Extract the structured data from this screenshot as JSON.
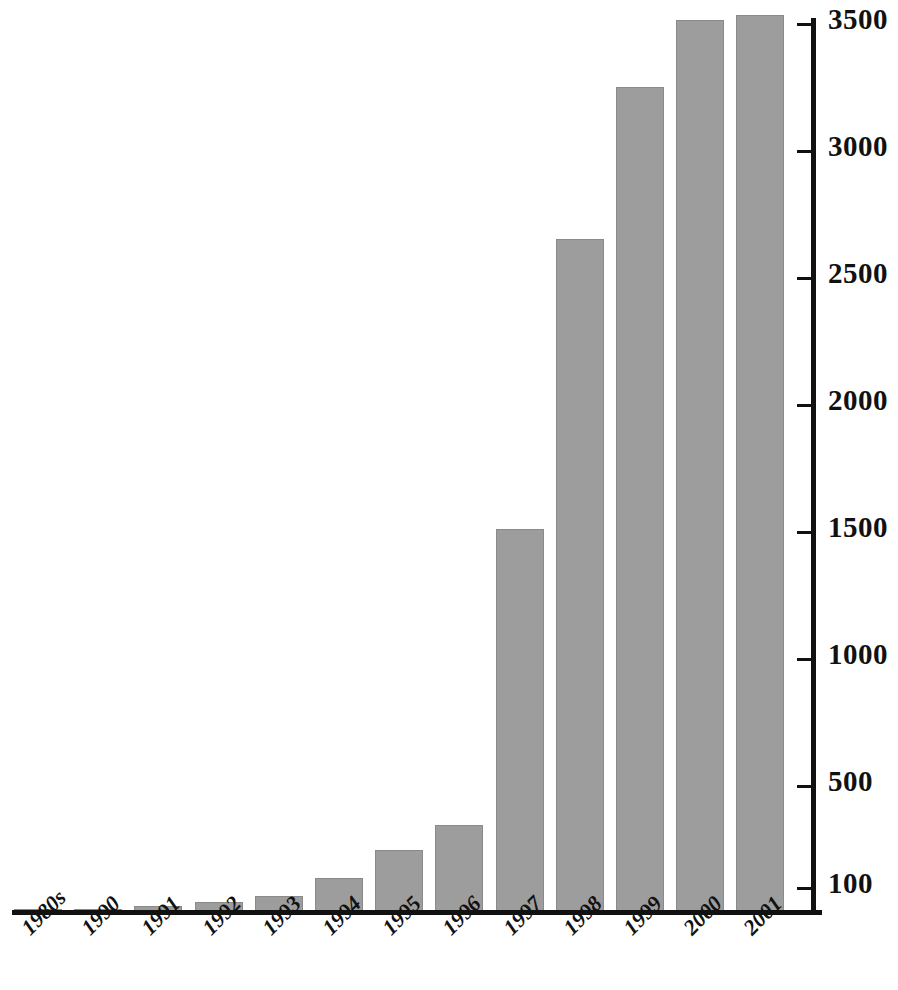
{
  "chart_data": {
    "type": "bar",
    "title": "",
    "xlabel": "",
    "ylabel": "",
    "categories": [
      "1980s",
      "1990",
      "1991",
      "1992",
      "1993",
      "1994",
      "1995",
      "1996",
      "1997",
      "1998",
      "1999",
      "2000",
      "2001"
    ],
    "values": [
      10,
      15,
      25,
      40,
      65,
      135,
      245,
      345,
      1510,
      2650,
      3250,
      3510,
      3530
    ],
    "ylim": [
      0,
      3600
    ],
    "yticks": [
      100,
      500,
      1000,
      1500,
      2000,
      2500,
      3000,
      3500
    ],
    "ytick_labels": [
      "100",
      "500",
      "1000",
      "1500",
      "2000",
      "2500",
      "3000",
      "3500"
    ],
    "grid": false,
    "legend": false,
    "bar_color": "#9d9d9d",
    "bar_edge_color": "#8a8a8a",
    "axis_color": "#111111",
    "y_axis_position": "right",
    "xtick_rotation": -45
  }
}
